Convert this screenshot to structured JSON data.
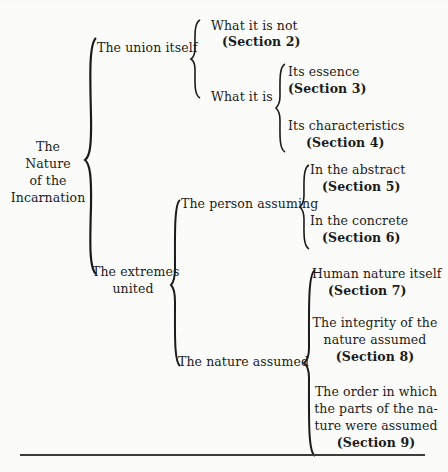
{
  "outline": {
    "root": [
      "The",
      "Nature",
      "of the",
      "Incarnation"
    ],
    "union": {
      "label": "The union itself",
      "not": {
        "text": "What it is not",
        "section": "(Section 2)"
      },
      "is": {
        "label": "What it is",
        "essence": {
          "text": "Its essence",
          "section": "(Section 3)"
        },
        "characteristics": {
          "text": "Its characteristics",
          "section": "(Section 4)"
        }
      }
    },
    "extremes": {
      "label": [
        "The extremes",
        "united"
      ],
      "person": {
        "label": "The person assuming",
        "abstract": {
          "text": "In the abstract",
          "section": "(Section 5)"
        },
        "concrete": {
          "text": "In the concrete",
          "section": "(Section 6)"
        }
      },
      "nature": {
        "label": "The nature assumed",
        "human": {
          "text": "Human nature itself",
          "section": "(Section 7)"
        },
        "integrity": {
          "lines": [
            "The integrity of the",
            "nature assumed"
          ],
          "section": "(Section 8)"
        },
        "order": {
          "lines": [
            "The order in which",
            "the parts of the na-",
            "ture were assumed"
          ],
          "section": "(Section 9)"
        }
      }
    }
  }
}
